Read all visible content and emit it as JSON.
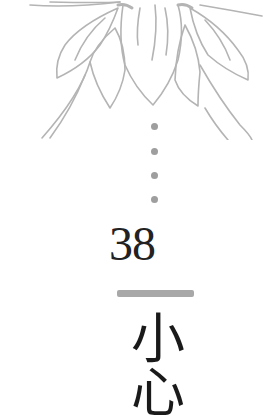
{
  "page": {
    "chapter_number": "38",
    "title": "小心",
    "colors": {
      "background": "#ffffff",
      "illustration_stroke": "#b4b4b4",
      "dot": "#9e9e9e",
      "divider": "#a8a8a8",
      "text": "#1a1a1a"
    },
    "decoration": {
      "illustration": "lotus-line-art",
      "dot_count": 4
    }
  }
}
